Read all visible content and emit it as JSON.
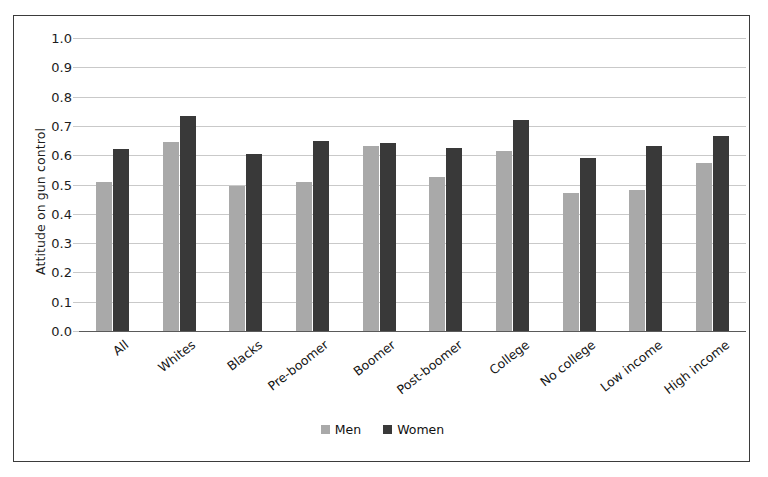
{
  "figure": {
    "background_color": "#ffffff",
    "frame_color": "#3b3b3b"
  },
  "chart_data": {
    "type": "bar",
    "title": "",
    "xlabel": "",
    "ylabel": "Attitude on gun control",
    "ylim": [
      0.0,
      1.0
    ],
    "grid": true,
    "legend_position": "bottom-center",
    "categories": [
      "All",
      "Whites",
      "Blacks",
      "Pre-boomer",
      "Boomer",
      "Post-boomer",
      "College",
      "No college",
      "Low income",
      "High income"
    ],
    "ytick_labels": [
      "1.0",
      "0.9",
      "0.8",
      "0.7",
      "0.6",
      "0.5",
      "0.4",
      "0.3",
      "0.2",
      "0.1",
      "0.0"
    ],
    "ytick_values": [
      1.0,
      0.9,
      0.8,
      0.7,
      0.6,
      0.5,
      0.4,
      0.3,
      0.2,
      0.1,
      0.0
    ],
    "series": [
      {
        "name": "Men",
        "color": "#a9a9a9",
        "values": [
          0.51,
          0.645,
          0.495,
          0.51,
          0.63,
          0.525,
          0.615,
          0.47,
          0.48,
          0.575
        ]
      },
      {
        "name": "Women",
        "color": "#393939",
        "values": [
          0.62,
          0.735,
          0.605,
          0.65,
          0.64,
          0.625,
          0.72,
          0.59,
          0.63,
          0.665
        ]
      }
    ]
  },
  "legend": {
    "items": [
      {
        "label": "Men",
        "color": "#a9a9a9"
      },
      {
        "label": "Women",
        "color": "#393939"
      }
    ]
  }
}
